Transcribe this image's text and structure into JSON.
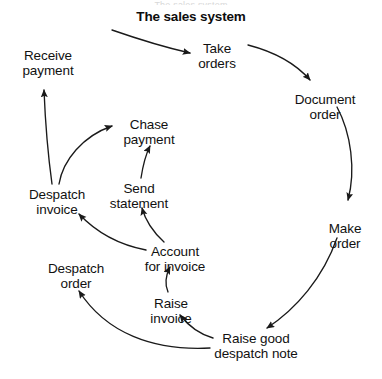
{
  "page": {
    "width": 382,
    "height": 379,
    "background": "#ffffff",
    "ink_color": "#1a1a1a",
    "cropped_header_text": "The sales system"
  },
  "title": {
    "text": "The sales system",
    "bold": true
  },
  "diagram": {
    "type": "process-cycle-flow",
    "orientation": "clockwise",
    "node_count": 11,
    "arrow_count": 11,
    "nodes": [
      {
        "id": "take-orders",
        "label": "Take\norders",
        "x": 217,
        "y": 42,
        "align": "center"
      },
      {
        "id": "document-order",
        "label": "Document\norder",
        "x": 325,
        "y": 93,
        "align": "center"
      },
      {
        "id": "make-order",
        "label": "Make\norder",
        "x": 345,
        "y": 222,
        "align": "center"
      },
      {
        "id": "raise-good-despatch",
        "label": "Raise good\ndespatch note",
        "x": 256,
        "y": 340,
        "align": "center"
      },
      {
        "id": "raise-invoice",
        "label": "Raise\ninvoice",
        "x": 171,
        "y": 304,
        "align": "center"
      },
      {
        "id": "despatch-order",
        "label": "Despatch\norder",
        "x": 76,
        "y": 270,
        "align": "center"
      },
      {
        "id": "account-for-invoice",
        "label": "Account\nfor invoice",
        "x": 175,
        "y": 253,
        "align": "center"
      },
      {
        "id": "send-statement",
        "label": "Send\nstatement",
        "x": 139,
        "y": 190,
        "align": "center"
      },
      {
        "id": "chase-payment",
        "label": "Chase\npayment",
        "x": 149,
        "y": 126,
        "align": "center"
      },
      {
        "id": "despatch-invoice",
        "label": "Despatch\ninvoice",
        "x": 57,
        "y": 196,
        "align": "center"
      },
      {
        "id": "receive-payment",
        "label": "Receive\npayment",
        "x": 48,
        "y": 57,
        "align": "center"
      }
    ],
    "edges": [
      {
        "id": "start-to-take-orders",
        "from": "start",
        "to": "take-orders"
      },
      {
        "id": "take-orders-to-document",
        "from": "take-orders",
        "to": "document-order"
      },
      {
        "id": "document-to-make",
        "from": "document-order",
        "to": "make-order"
      },
      {
        "id": "make-to-raise-good",
        "from": "make-order",
        "to": "raise-good-despatch"
      },
      {
        "id": "raise-good-to-raise-inv",
        "from": "raise-good-despatch",
        "to": "raise-invoice"
      },
      {
        "id": "raise-good-to-despatch-ord",
        "from": "raise-good-despatch",
        "to": "despatch-order"
      },
      {
        "id": "raise-inv-to-account",
        "from": "raise-invoice",
        "to": "account-for-invoice"
      },
      {
        "id": "account-to-despatch-inv",
        "from": "account-for-invoice",
        "to": "despatch-invoice"
      },
      {
        "id": "account-to-send-stmt",
        "from": "account-for-invoice",
        "to": "send-statement"
      },
      {
        "id": "send-stmt-to-chase",
        "from": "send-statement",
        "to": "chase-payment"
      },
      {
        "id": "despatch-inv-to-chase",
        "from": "despatch-invoice",
        "to": "chase-payment"
      },
      {
        "id": "despatch-inv-to-receive",
        "from": "despatch-invoice",
        "to": "receive-payment"
      }
    ]
  }
}
